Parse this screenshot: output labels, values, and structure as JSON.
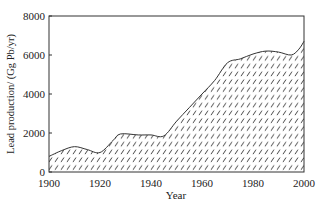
{
  "chart_data": {
    "type": "area",
    "title": "",
    "xlabel": "Year",
    "ylabel": "Lead production/ (Gg Pb/yr)",
    "xlim": [
      1900,
      2000
    ],
    "ylim": [
      0,
      8000
    ],
    "x_ticks": [
      1900,
      1920,
      1940,
      1960,
      1980,
      2000
    ],
    "y_ticks": [
      0,
      2000,
      4000,
      6000,
      8000
    ],
    "grid": false,
    "legend": null,
    "fill": "diagonal-hatch",
    "series": [
      {
        "name": "Lead production",
        "x": [
          1900,
          1905,
          1910,
          1915,
          1920,
          1925,
          1928,
          1935,
          1940,
          1945,
          1950,
          1955,
          1960,
          1965,
          1970,
          1975,
          1980,
          1985,
          1990,
          1995,
          1998,
          2000
        ],
        "values": [
          800,
          1100,
          1300,
          1150,
          1000,
          1600,
          1950,
          1900,
          1900,
          1850,
          2600,
          3300,
          4000,
          4700,
          5600,
          5800,
          6050,
          6200,
          6150,
          6000,
          6300,
          6700
        ]
      }
    ]
  }
}
